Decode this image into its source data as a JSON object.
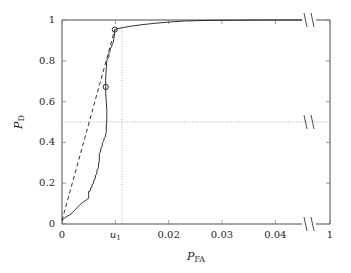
{
  "chart_data": {
    "type": "line",
    "title": "",
    "subtitle": "",
    "xlabel": "P_FA",
    "xlabel_base": "P",
    "xlabel_sub": "FA",
    "ylabel": "P_D",
    "ylabel_base": "P",
    "ylabel_sub": "D",
    "xlim": [
      0,
      0.048
    ],
    "ylim": [
      0,
      1
    ],
    "x_axis_broken": true,
    "x_break_after": 0.045,
    "x_final_tick": 1,
    "grid": false,
    "legend_position": "none",
    "xticks": [
      {
        "value": 0,
        "label": "0"
      },
      {
        "value": 0.01,
        "label": "u₁",
        "label_base": "u",
        "label_sub": "1",
        "italic": true
      },
      {
        "value": 0.02,
        "label": "0.02"
      },
      {
        "value": 0.03,
        "label": "0.03"
      },
      {
        "value": 0.04,
        "label": "0.04"
      },
      {
        "value": 0.048,
        "label": "1"
      }
    ],
    "yticks": [
      {
        "value": 0,
        "label": "0"
      },
      {
        "value": 0.2,
        "label": "0.2"
      },
      {
        "value": 0.4,
        "label": "0.4"
      },
      {
        "value": 0.6,
        "label": "0.6"
      },
      {
        "value": 0.8,
        "label": "0.8"
      },
      {
        "value": 1,
        "label": "1"
      }
    ],
    "annotations": [
      {
        "name": "vertical-guide-u1",
        "type": "dotted-vline",
        "x": 0.01,
        "from_y": 0,
        "to_y": 0.955
      },
      {
        "name": "horizontal-guide-half",
        "type": "dotted-hline",
        "y": 0.5,
        "from_x": 0,
        "to_x": 0.048
      }
    ],
    "markers": [
      {
        "name": "operating-point-lower",
        "x": 0.0082,
        "y": 0.672,
        "shape": "circle-open"
      },
      {
        "name": "operating-point-knee",
        "x": 0.0099,
        "y": 0.953,
        "shape": "circle-open"
      }
    ],
    "series": [
      {
        "name": "roc-empirical",
        "style": "solid",
        "color": "#1a1a1a",
        "points": [
          [
            0.0,
            0.018
          ],
          [
            0.0005,
            0.03
          ],
          [
            0.001,
            0.038
          ],
          [
            0.0015,
            0.046
          ],
          [
            0.002,
            0.057
          ],
          [
            0.0024,
            0.068
          ],
          [
            0.0028,
            0.08
          ],
          [
            0.0032,
            0.09
          ],
          [
            0.0036,
            0.1
          ],
          [
            0.004,
            0.108
          ],
          [
            0.0044,
            0.115
          ],
          [
            0.0048,
            0.121
          ],
          [
            0.005,
            0.128
          ],
          [
            0.005,
            0.16
          ],
          [
            0.0053,
            0.162
          ],
          [
            0.0054,
            0.178
          ],
          [
            0.0056,
            0.18
          ],
          [
            0.0057,
            0.196
          ],
          [
            0.0059,
            0.199
          ],
          [
            0.006,
            0.216
          ],
          [
            0.0062,
            0.22
          ],
          [
            0.0063,
            0.24
          ],
          [
            0.0065,
            0.244
          ],
          [
            0.0066,
            0.268
          ],
          [
            0.0068,
            0.272
          ],
          [
            0.0069,
            0.3
          ],
          [
            0.007,
            0.31
          ],
          [
            0.007,
            0.345
          ],
          [
            0.0072,
            0.352
          ],
          [
            0.0073,
            0.372
          ],
          [
            0.0075,
            0.378
          ],
          [
            0.0076,
            0.398
          ],
          [
            0.0078,
            0.404
          ],
          [
            0.0079,
            0.42
          ],
          [
            0.0081,
            0.425
          ],
          [
            0.0082,
            0.44
          ],
          [
            0.0083,
            0.45
          ],
          [
            0.0083,
            0.485
          ],
          [
            0.0084,
            0.5
          ],
          [
            0.0084,
            0.56
          ],
          [
            0.0083,
            0.6
          ],
          [
            0.0082,
            0.64
          ],
          [
            0.0082,
            0.672
          ],
          [
            0.0082,
            0.72
          ],
          [
            0.0083,
            0.76
          ],
          [
            0.0084,
            0.8
          ],
          [
            0.0086,
            0.812
          ],
          [
            0.0088,
            0.818
          ],
          [
            0.0088,
            0.84
          ],
          [
            0.009,
            0.846
          ],
          [
            0.0091,
            0.862
          ],
          [
            0.0093,
            0.868
          ],
          [
            0.0094,
            0.882
          ],
          [
            0.0096,
            0.888
          ],
          [
            0.0097,
            0.905
          ],
          [
            0.0098,
            0.92
          ],
          [
            0.0099,
            0.94
          ],
          [
            0.0099,
            0.953
          ],
          [
            0.0105,
            0.958
          ],
          [
            0.0115,
            0.963
          ],
          [
            0.013,
            0.97
          ],
          [
            0.015,
            0.977
          ],
          [
            0.0175,
            0.984
          ],
          [
            0.02,
            0.99
          ],
          [
            0.023,
            0.995
          ],
          [
            0.027,
            0.998
          ],
          [
            0.032,
            0.999
          ],
          [
            0.04,
            1.0
          ],
          [
            0.045,
            1.0
          ]
        ]
      },
      {
        "name": "roc-chance-chord",
        "style": "dashed",
        "color": "#1a1a1a",
        "points": [
          [
            0.0,
            0.018
          ],
          [
            0.0099,
            0.953
          ]
        ]
      }
    ]
  },
  "axis": {
    "frame_color": "#4d4d4d",
    "tick_color": "#808080",
    "dotted_color": "#999999",
    "break_symbol": "||"
  }
}
